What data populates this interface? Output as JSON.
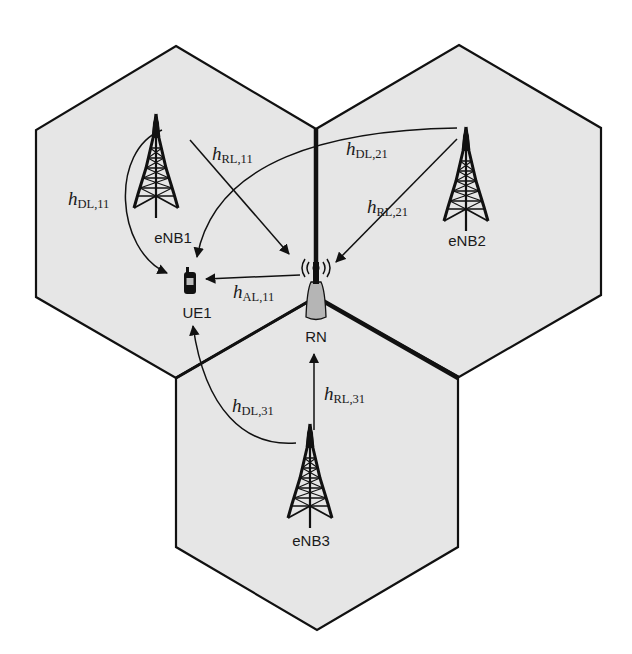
{
  "colors": {
    "cell_fill": "#e6e6e6",
    "cell_stroke": "#111111",
    "background": "#ffffff",
    "ink": "#1a1a1a"
  },
  "cells": [
    {
      "id": "cell-1",
      "center": [
        176,
        212
      ]
    },
    {
      "id": "cell-2",
      "center": [
        459,
        211
      ]
    },
    {
      "id": "cell-3",
      "center": [
        317,
        463
      ]
    }
  ],
  "nodes": {
    "enb1": {
      "label": "eNB1",
      "icon": "cell-tower-icon"
    },
    "enb2": {
      "label": "eNB2",
      "icon": "cell-tower-icon"
    },
    "enb3": {
      "label": "eNB3",
      "icon": "cell-tower-icon"
    },
    "rn": {
      "label": "RN",
      "icon": "relay-antenna-icon"
    },
    "ue1": {
      "label": "UE1",
      "icon": "mobile-phone-icon"
    }
  },
  "channels": {
    "h_dl_11": {
      "symbol": "h",
      "subscript": "DL,11",
      "from": "eNB1",
      "to": "UE1"
    },
    "h_rl_11": {
      "symbol": "h",
      "subscript": "RL,11",
      "from": "eNB1",
      "to": "RN"
    },
    "h_dl_21": {
      "symbol": "h",
      "subscript": "DL,21",
      "from": "eNB2",
      "to": "UE1"
    },
    "h_rl_21": {
      "symbol": "h",
      "subscript": "RL,21",
      "from": "eNB2",
      "to": "RN"
    },
    "h_al_11": {
      "symbol": "h",
      "subscript": "AL,11",
      "from": "RN",
      "to": "UE1"
    },
    "h_dl_31": {
      "symbol": "h",
      "subscript": "DL,31",
      "from": "eNB3",
      "to": "UE1"
    },
    "h_rl_31": {
      "symbol": "h",
      "subscript": "RL,31",
      "from": "eNB3",
      "to": "RN"
    }
  }
}
